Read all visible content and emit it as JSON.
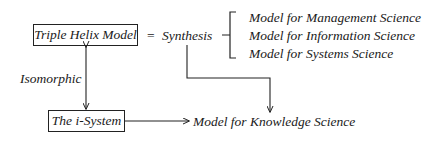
{
  "diagram": {
    "nodes": {
      "triple_helix": "Triple Helix Model",
      "equals": "=",
      "synthesis": "Synthesis",
      "i_system": "The i-System",
      "knowledge_model": "Model for Knowledge Science"
    },
    "models": [
      "Model for Management Science",
      "Model for Information Science",
      "Model for Systems Science"
    ],
    "edge_labels": {
      "isomorphic": "Isomorphic"
    }
  }
}
